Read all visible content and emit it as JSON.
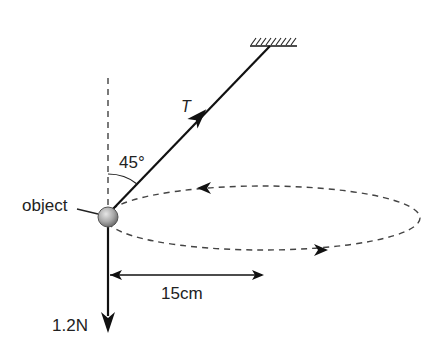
{
  "diagram": {
    "labels": {
      "tension": "T",
      "angle": "45°",
      "object": "object",
      "radius": "15cm",
      "weight": "1.2N"
    },
    "quantities": {
      "angle_from_vertical_deg": 45,
      "radius_cm": 15,
      "weight_N": 1.2
    },
    "colors": {
      "line": "#111111",
      "dashed": "#444444",
      "ball_fill": "#a9a9a9",
      "text": "#222222"
    }
  }
}
